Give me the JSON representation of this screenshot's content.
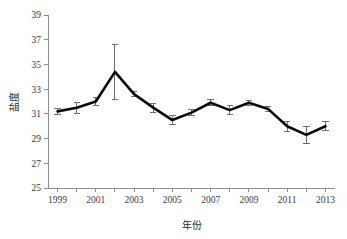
{
  "chart_data": {
    "type": "line",
    "title": "",
    "xlabel": "年份",
    "ylabel": "盐度",
    "x": [
      1999,
      2000,
      2001,
      2002,
      2003,
      2004,
      2005,
      2006,
      2007,
      2008,
      2009,
      2010,
      2011,
      2012,
      2013
    ],
    "values": [
      31.2,
      31.5,
      32.0,
      34.4,
      32.6,
      31.5,
      30.5,
      31.1,
      31.9,
      31.3,
      31.9,
      31.4,
      30.0,
      29.3,
      30.0
    ],
    "errors": [
      0.25,
      0.45,
      0.3,
      2.2,
      0.2,
      0.35,
      0.35,
      0.25,
      0.25,
      0.35,
      0.2,
      0.2,
      0.4,
      0.7,
      0.35
    ],
    "xlim": [
      1998.5,
      2013.5
    ],
    "ylim": [
      25,
      39
    ],
    "yticks": [
      25,
      27,
      29,
      31,
      33,
      35,
      37,
      39
    ],
    "ytick_labels": [
      "25",
      "27",
      "29",
      "31",
      "33",
      "35",
      "37",
      "39"
    ],
    "xticks": [
      1999,
      2000,
      2001,
      2002,
      2003,
      2004,
      2005,
      2006,
      2007,
      2008,
      2009,
      2010,
      2011,
      2012,
      2013
    ],
    "xtick_labels": [
      "1999",
      "",
      "2001",
      "",
      "2003",
      "",
      "2005",
      "",
      "2007",
      "",
      "2009",
      "",
      "2011",
      "",
      "2013"
    ],
    "grid": false,
    "legend": null,
    "series_color": "#0b0b0b",
    "error_bar_color": "#6e6e6e",
    "axis_color": "#8c8c8c"
  }
}
